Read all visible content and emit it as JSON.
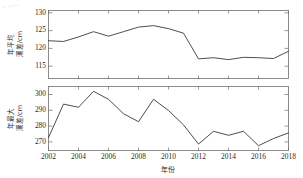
{
  "figure": {
    "width": 303,
    "height": 178,
    "background": "#ffffff",
    "line_color": "#3a3a3a",
    "axis_color": "#6f6f6f",
    "text_color": "#2b2b2b",
    "corner_artifact": "~~~"
  },
  "xlabel": "年份",
  "x_ticks": [
    "2002",
    "2004",
    "2006",
    "2008",
    "2010",
    "2012",
    "2014",
    "2016",
    "2018"
  ],
  "top_panel": {
    "ylabel_line1": "年平均",
    "ylabel_line2": "潮差/cm",
    "ylabel": "年平均潮差/cm",
    "y_ticks": [
      "130",
      "125",
      "120",
      "115"
    ]
  },
  "bottom_panel": {
    "ylabel_line1": "年最大",
    "ylabel_line2": "潮差/cm",
    "ylabel": "年最大潮差/cm",
    "y_ticks": [
      "300",
      "290",
      "280",
      "270"
    ]
  },
  "chart_data": [
    {
      "type": "line",
      "title": "年平均潮差/cm",
      "xlabel": "年份",
      "ylabel": "年平均潮差/cm",
      "xlim": [
        2002,
        2018
      ],
      "ylim": [
        112,
        130
      ],
      "yticks": [
        115,
        120,
        125,
        130
      ],
      "xticks": [
        2002,
        2004,
        2006,
        2008,
        2010,
        2012,
        2014,
        2016,
        2018
      ],
      "grid": false,
      "legend": "none",
      "x": [
        2002,
        2003,
        2004,
        2005,
        2006,
        2007,
        2008,
        2009,
        2010,
        2011,
        2012,
        2013,
        2014,
        2015,
        2016,
        2017,
        2018
      ],
      "values": [
        122.0,
        121.8,
        123.0,
        124.4,
        123.2,
        124.4,
        125.6,
        126.0,
        125.2,
        124.0,
        117.2,
        117.5,
        117.0,
        117.6,
        117.5,
        117.3,
        119.2
      ],
      "series": [
        {
          "name": "年平均潮差",
          "values": [
            122.0,
            121.8,
            123.0,
            124.4,
            123.2,
            124.4,
            125.6,
            126.0,
            125.2,
            124.0,
            117.2,
            117.5,
            117.0,
            117.6,
            117.5,
            117.3,
            119.2
          ]
        }
      ]
    },
    {
      "type": "line",
      "title": "年最大潮差/cm",
      "xlabel": "年份",
      "ylabel": "年最大潮差/cm",
      "xlim": [
        2002,
        2018
      ],
      "ylim": [
        265,
        305
      ],
      "yticks": [
        270,
        280,
        290,
        300
      ],
      "xticks": [
        2002,
        2004,
        2006,
        2008,
        2010,
        2012,
        2014,
        2016,
        2018
      ],
      "grid": false,
      "legend": "none",
      "x": [
        2002,
        2003,
        2004,
        2005,
        2006,
        2007,
        2008,
        2009,
        2010,
        2011,
        2012,
        2013,
        2014,
        2015,
        2016,
        2017,
        2018
      ],
      "values": [
        273.0,
        294.0,
        292.0,
        302.0,
        297.0,
        288.0,
        283.0,
        297.0,
        290.0,
        281.0,
        269.0,
        277.0,
        274.5,
        277.0,
        268.0,
        272.5,
        276.0
      ],
      "series": [
        {
          "name": "年最大潮差",
          "values": [
            273.0,
            294.0,
            292.0,
            302.0,
            297.0,
            288.0,
            283.0,
            297.0,
            290.0,
            281.0,
            269.0,
            277.0,
            274.5,
            277.0,
            268.0,
            272.5,
            276.0
          ]
        }
      ]
    }
  ]
}
